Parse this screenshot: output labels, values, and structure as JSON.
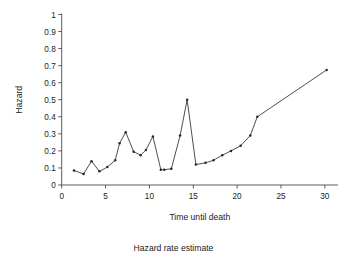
{
  "chart_data": {
    "type": "line",
    "title": "",
    "caption": "Hazard rate estimate",
    "xlabel": "Time until death",
    "ylabel": "Hazard",
    "xlim": [
      0,
      31.5
    ],
    "ylim": [
      0,
      1
    ],
    "grid": false,
    "legend": null,
    "markers": "filled-dot",
    "xticks": [
      0,
      5,
      10,
      15,
      20,
      25,
      30
    ],
    "xticklabels": [
      "0",
      "5",
      "10",
      "15",
      "20",
      "25",
      "30"
    ],
    "yticks": [
      0,
      0.1,
      0.2,
      0.3,
      0.4,
      0.5,
      0.6,
      0.7,
      0.8,
      0.9,
      1
    ],
    "yticklabels": [
      "0",
      "0.1",
      "0.2",
      "0.3",
      "0.4",
      "0.5",
      "0.6",
      "0.7",
      "0.8",
      "0.9",
      "1"
    ],
    "x": [
      1.4,
      2.5,
      3.4,
      4.3,
      5.2,
      6.1,
      6.6,
      7.3,
      8.2,
      9.0,
      9.6,
      10.4,
      11.3,
      11.7,
      12.5,
      13.5,
      14.3,
      15.3,
      16.4,
      17.3,
      18.3,
      19.3,
      20.4,
      21.5,
      22.3,
      30.2
    ],
    "y": [
      0.085,
      0.065,
      0.14,
      0.08,
      0.105,
      0.145,
      0.245,
      0.31,
      0.195,
      0.175,
      0.205,
      0.285,
      0.09,
      0.09,
      0.095,
      0.29,
      0.5,
      0.12,
      0.13,
      0.145,
      0.175,
      0.2,
      0.23,
      0.29,
      0.4,
      0.675
    ],
    "series": [
      {
        "name": "Hazard",
        "values": [
          0.085,
          0.065,
          0.14,
          0.08,
          0.105,
          0.145,
          0.245,
          0.31,
          0.195,
          0.175,
          0.205,
          0.285,
          0.09,
          0.09,
          0.095,
          0.29,
          0.5,
          0.12,
          0.13,
          0.145,
          0.175,
          0.2,
          0.23,
          0.29,
          0.4,
          0.675
        ]
      }
    ]
  }
}
